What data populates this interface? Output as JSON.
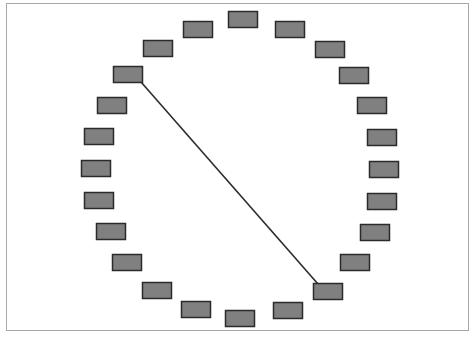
{
  "diagram": {
    "type": "ring-of-nodes",
    "node_count": 24,
    "node_size": {
      "width": 29,
      "height": 16
    },
    "node_fill": "#808080",
    "node_stroke": "#2b2b2b",
    "edge_color": "#2b2b2b",
    "frame_color": "#a8a8a8",
    "nodes": [
      {
        "id": 0,
        "x": 228,
        "y": 11
      },
      {
        "id": 1,
        "x": 275,
        "y": 21
      },
      {
        "id": 2,
        "x": 315,
        "y": 41
      },
      {
        "id": 3,
        "x": 339,
        "y": 67
      },
      {
        "id": 4,
        "x": 357,
        "y": 97
      },
      {
        "id": 5,
        "x": 367,
        "y": 129
      },
      {
        "id": 6,
        "x": 369,
        "y": 161
      },
      {
        "id": 7,
        "x": 367,
        "y": 193
      },
      {
        "id": 8,
        "x": 360,
        "y": 224
      },
      {
        "id": 9,
        "x": 340,
        "y": 254
      },
      {
        "id": 10,
        "x": 313,
        "y": 283
      },
      {
        "id": 11,
        "x": 273,
        "y": 302
      },
      {
        "id": 12,
        "x": 225,
        "y": 310
      },
      {
        "id": 13,
        "x": 181,
        "y": 301
      },
      {
        "id": 14,
        "x": 142,
        "y": 282
      },
      {
        "id": 15,
        "x": 112,
        "y": 254
      },
      {
        "id": 16,
        "x": 96,
        "y": 223
      },
      {
        "id": 17,
        "x": 84,
        "y": 192
      },
      {
        "id": 18,
        "x": 81,
        "y": 160
      },
      {
        "id": 19,
        "x": 84,
        "y": 128
      },
      {
        "id": 20,
        "x": 97,
        "y": 97
      },
      {
        "id": 21,
        "x": 113,
        "y": 66
      },
      {
        "id": 22,
        "x": 143,
        "y": 40
      },
      {
        "id": 23,
        "x": 183,
        "y": 21
      }
    ],
    "edges": [
      {
        "from": 21,
        "to": 10,
        "x1": 141,
        "y1": 82,
        "x2": 318,
        "y2": 284
      }
    ]
  }
}
